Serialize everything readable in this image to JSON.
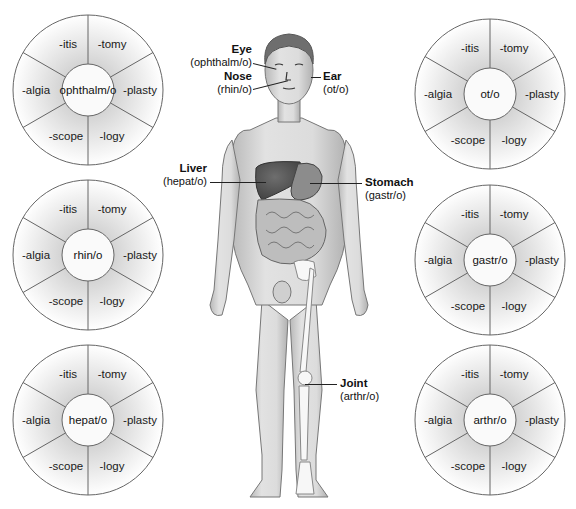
{
  "wheels": [
    {
      "id": "eye",
      "root": "ophthalm/o",
      "suffixes": {
        "top_left": "-itis",
        "top_right": "-tomy",
        "left": "-algia",
        "right": "-plasty",
        "bottom_left": "-scope",
        "bottom_right": "-logy"
      }
    },
    {
      "id": "nose",
      "root": "rhin/o",
      "suffixes": {
        "top_left": "-itis",
        "top_right": "-tomy",
        "left": "-algia",
        "right": "-plasty",
        "bottom_left": "-scope",
        "bottom_right": "-logy"
      }
    },
    {
      "id": "liver",
      "root": "hepat/o",
      "suffixes": {
        "top_left": "-itis",
        "top_right": "-tomy",
        "left": "-algia",
        "right": "-plasty",
        "bottom_left": "-scope",
        "bottom_right": "-logy"
      }
    },
    {
      "id": "ear",
      "root": "ot/o",
      "suffixes": {
        "top_left": "-itis",
        "top_right": "-tomy",
        "left": "-algia",
        "right": "-plasty",
        "bottom_left": "-scope",
        "bottom_right": "-logy"
      }
    },
    {
      "id": "stomach",
      "root": "gastr/o",
      "suffixes": {
        "top_left": "-itis",
        "top_right": "-tomy",
        "left": "-algia",
        "right": "-plasty",
        "bottom_left": "-scope",
        "bottom_right": "-logy"
      }
    },
    {
      "id": "joint",
      "root": "arthr/o",
      "suffixes": {
        "top_left": "-itis",
        "top_right": "-tomy",
        "left": "-algia",
        "right": "-plasty",
        "bottom_left": "-scope",
        "bottom_right": "-logy"
      }
    }
  ],
  "callouts": {
    "eye": {
      "name": "Eye",
      "root": "(ophthalm/o)"
    },
    "nose": {
      "name": "Nose",
      "root": "(rhin/o)"
    },
    "ear": {
      "name": "Ear",
      "root": "(ot/o)"
    },
    "liver": {
      "name": "Liver",
      "root": "(hepat/o)"
    },
    "stomach": {
      "name": "Stomach",
      "root": "(gastr/o)"
    },
    "joint": {
      "name": "Joint",
      "root": "(arthr/o)"
    }
  },
  "colors": {
    "line": "#555555",
    "skin": "#d9d9d9",
    "skin_shadow": "#a8a8a8",
    "liver": "#5a5a5a",
    "stomach": "#8c8c8c",
    "intestine": "#bdbdbd",
    "bone": "#f7f7f7",
    "hair": "#6e6e6e"
  }
}
